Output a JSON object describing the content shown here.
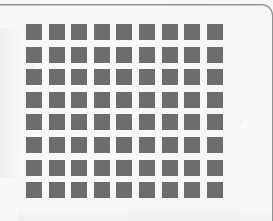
{
  "page": {
    "kind": "scanned-document-fragment",
    "background_color": "#f9f9f8",
    "rule_color": "#8e8e90"
  },
  "grid": {
    "columns": 9,
    "rows": 8,
    "total_squares": 72,
    "square_color": "#6d6d6d",
    "square_size_px": 16,
    "gap_px": 6.6,
    "origin_x_px": 26,
    "origin_y_px": 24,
    "cells": [
      [
        "filled",
        "filled",
        "filled",
        "filled",
        "filled",
        "filled",
        "filled",
        "filled",
        "filled"
      ],
      [
        "filled",
        "filled",
        "filled",
        "filled",
        "filled",
        "filled",
        "filled",
        "filled",
        "filled"
      ],
      [
        "filled",
        "filled",
        "filled",
        "filled",
        "filled",
        "filled",
        "filled",
        "filled",
        "filled"
      ],
      [
        "filled",
        "filled",
        "filled",
        "filled",
        "filled",
        "filled",
        "filled",
        "filled",
        "filled"
      ],
      [
        "filled",
        "filled",
        "filled",
        "filled",
        "filled",
        "filled",
        "filled",
        "filled",
        "filled"
      ],
      [
        "filled",
        "filled",
        "filled",
        "filled",
        "filled",
        "filled",
        "filled",
        "filled",
        "filled"
      ],
      [
        "filled",
        "filled",
        "filled",
        "filled",
        "filled",
        "filled",
        "filled",
        "filled",
        "filled"
      ],
      [
        "filled",
        "filled",
        "filled",
        "filled",
        "filled",
        "filled",
        "filled",
        "filled",
        "filled"
      ]
    ]
  }
}
